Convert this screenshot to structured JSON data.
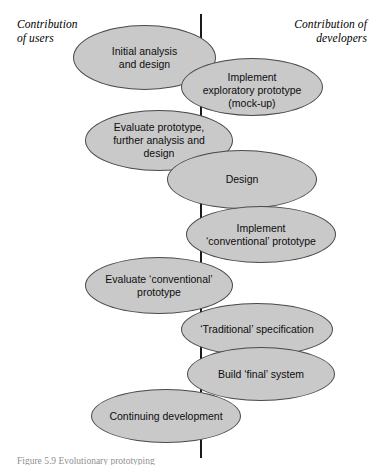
{
  "figure": {
    "headers": {
      "left": "Contribution\nof users",
      "right": "Contribution of\ndevelopers"
    },
    "caption": "Figure 5.9 Evolutionary prototyping",
    "colors": {
      "ellipse_fill": "#c9c9c9",
      "ellipse_stroke": "#4a4a4a",
      "axis_line": "#1a1a1a",
      "text": "#0d0d0d",
      "background": "#ffffff"
    },
    "axis": {
      "orientation": "vertical",
      "x": 201,
      "y_top": 14,
      "y_bottom": 458
    },
    "nodes": [
      {
        "label": "Initial analysis\nand design",
        "side": "users"
      },
      {
        "label": "Implement\nexploratory prototype\n(mock-up)",
        "side": "developers"
      },
      {
        "label": "Evaluate prototype,\nfurther analysis and\ndesign",
        "side": "users"
      },
      {
        "label": "Design",
        "side": "developers"
      },
      {
        "label": "Implement\n‘conventional’ prototype",
        "side": "developers"
      },
      {
        "label": "Evaluate ‘conventional’\nprototype",
        "side": "users"
      },
      {
        "label": "‘Traditional’ specification",
        "side": "developers"
      },
      {
        "label": "Build ‘final’ system",
        "side": "developers"
      },
      {
        "label": "Continuing development",
        "side": "users"
      }
    ]
  }
}
